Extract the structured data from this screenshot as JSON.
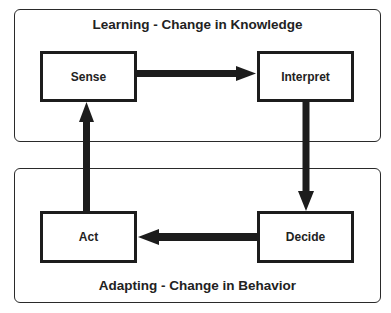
{
  "groups": {
    "learning": {
      "title": "Learning - Change in Knowledge"
    },
    "adapting": {
      "title": "Adapting - Change in Behavior"
    }
  },
  "nodes": {
    "sense": {
      "label": "Sense"
    },
    "interpret": {
      "label": "Interpret"
    },
    "decide": {
      "label": "Decide"
    },
    "act": {
      "label": "Act"
    }
  },
  "edges": [
    {
      "from": "Sense",
      "to": "Interpret"
    },
    {
      "from": "Interpret",
      "to": "Decide"
    },
    {
      "from": "Decide",
      "to": "Act"
    },
    {
      "from": "Act",
      "to": "Sense"
    }
  ],
  "colors": {
    "stroke": "#1c1c1c",
    "background": "#ffffff"
  }
}
